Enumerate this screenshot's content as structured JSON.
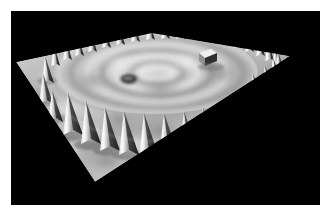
{
  "figure": {
    "kind": "stm-3d-topograph",
    "background_color": "#ffffff",
    "canvas_color": "#000000",
    "canvas": {
      "x": 11,
      "y": 11,
      "width": 309,
      "height": 194
    },
    "caption": "",
    "title": "",
    "alt_text": "Three-dimensional grayscale STM topograph of a quantum corral: a closed ring of adatoms rendered as sharp cones standing on a flat metal terrace, with circular electron standing-wave ripples inside the ring."
  },
  "render": {
    "colormap": "grayscale",
    "surface_light_gray": "#d9d9d9",
    "surface_mid_gray": "#a8a8a8",
    "surface_dark_gray": "#5a5a5a",
    "shadow_gray": "#2a2a2a",
    "highlight_white": "#f2f2f2",
    "void_black": "#000000",
    "light_direction": "upper-left",
    "projection": "oblique-perspective"
  },
  "surface": {
    "name": "terrace-plane",
    "corner_back": {
      "x": 152,
      "y": 33
    },
    "corner_left": {
      "x": 16,
      "y": 62
    },
    "corner_right": {
      "x": 290,
      "y": 56
    },
    "corner_front": {
      "x": 95,
      "y": 182
    }
  },
  "corral": {
    "label": "quantum-corral-ring",
    "adatom_count": 48,
    "ring_center": {
      "x": 154,
      "y": 70
    },
    "ring_radius_x": 110,
    "ring_radius_y": 48,
    "cone_height_back": 26,
    "cone_height_front": 44,
    "cone_half_width_back": 5,
    "cone_half_width_front": 9
  },
  "features": [
    {
      "name": "elliptical-pit-defect",
      "type": "depression",
      "center": {
        "x": 118,
        "y": 68
      },
      "radius_x": 9,
      "radius_y": 5,
      "tone": "#3c3c3c"
    },
    {
      "name": "square-adcluster",
      "type": "protrusion",
      "center": {
        "x": 199,
        "y": 45
      },
      "width": 13,
      "height": 11,
      "tone": "#efefef"
    }
  ],
  "standing_waves": {
    "name": "electron-standing-waves",
    "visible": true,
    "ring_count": 4,
    "center": {
      "x": 150,
      "y": 72
    },
    "rings": [
      {
        "rx": 18,
        "ry": 8
      },
      {
        "rx": 40,
        "ry": 17
      },
      {
        "rx": 62,
        "ry": 26
      },
      {
        "rx": 84,
        "ry": 35
      }
    ]
  },
  "chart_data": {
    "type": "heatmap",
    "title": "",
    "xlabel": "",
    "ylabel": "",
    "z_units": "arbitrary (apparent height)",
    "grid": false,
    "legend": "none"
  }
}
